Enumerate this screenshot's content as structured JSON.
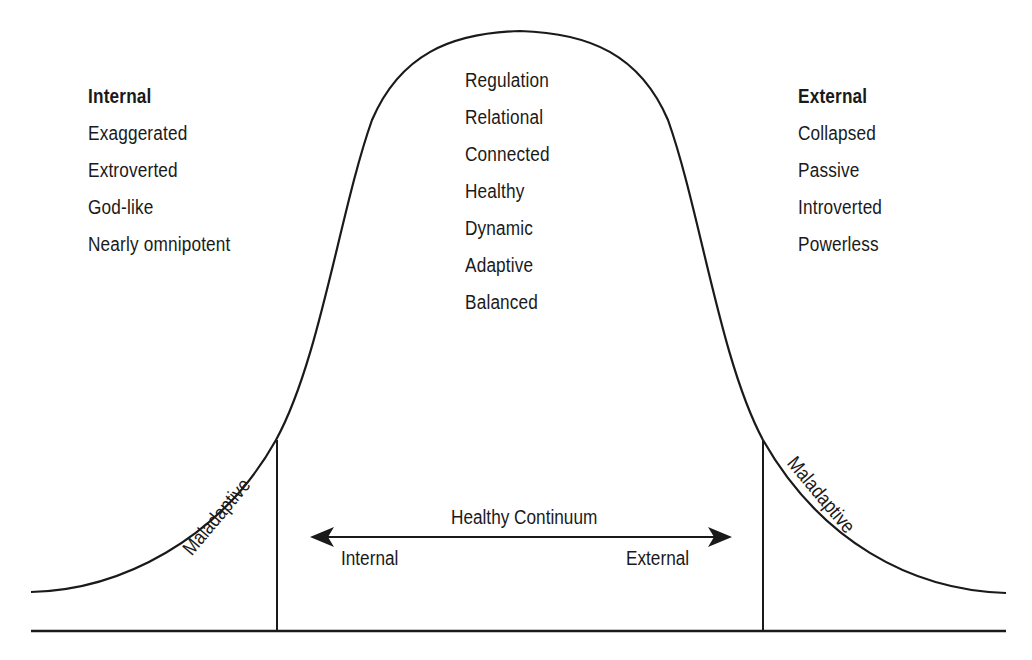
{
  "diagram": {
    "type": "bell-curve",
    "stroke_color": "#1a1a1a",
    "background": "#ffffff"
  },
  "left_panel": {
    "heading": "Internal",
    "items": [
      "Exaggerated",
      "Extroverted",
      "God-like",
      "Nearly omnipotent"
    ]
  },
  "center_panel": {
    "items": [
      "Regulation",
      "Relational",
      "Connected",
      "Healthy",
      "Dynamic",
      "Adaptive",
      "Balanced"
    ]
  },
  "right_panel": {
    "heading": "External",
    "items": [
      "Collapsed",
      "Passive",
      "Introverted",
      "Powerless"
    ]
  },
  "tails": {
    "left_label": "Maladaptive",
    "right_label": "Maladaptive"
  },
  "continuum": {
    "title": "Healthy Continuum",
    "left_label": "Internal",
    "right_label": "External"
  }
}
